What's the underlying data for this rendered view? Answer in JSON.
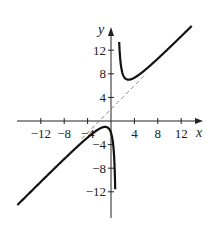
{
  "chart_data": {
    "type": "line",
    "title": "",
    "xlabel": "x",
    "ylabel": "y",
    "xlim": [
      -16,
      15.5
    ],
    "ylim": [
      -16,
      16
    ],
    "grid": false,
    "x_ticks": [
      -12,
      -8,
      -4,
      4,
      8,
      12
    ],
    "y_ticks": [
      -12,
      -8,
      -4,
      4,
      8,
      12
    ],
    "x_tick_labels": [
      "−12",
      "−8",
      "−4",
      "4",
      "8",
      "12"
    ],
    "y_tick_labels": [
      "−12",
      "−8",
      "−4",
      "4",
      "8",
      "12"
    ],
    "series": [
      {
        "name": "f(x) = x + 2 + 4/(x − 1)",
        "style": "solid",
        "color": "#111111",
        "function": "x + 2 + 4/(x - 1)",
        "branches": [
          {
            "x_range": [
              -16,
              0.72
            ]
          },
          {
            "x_range": [
              1.4,
              13.8
            ]
          }
        ],
        "key_points": [
          {
            "label": "local max",
            "x": -1,
            "y": -1
          },
          {
            "label": "local min",
            "x": 3,
            "y": 7
          }
        ]
      },
      {
        "name": "slant asymptote y = x + 2",
        "style": "dashed",
        "color": "#666666",
        "function": "x + 2",
        "x_range": [
          -5,
          6
        ]
      }
    ],
    "vertical_asymptote": 1
  }
}
